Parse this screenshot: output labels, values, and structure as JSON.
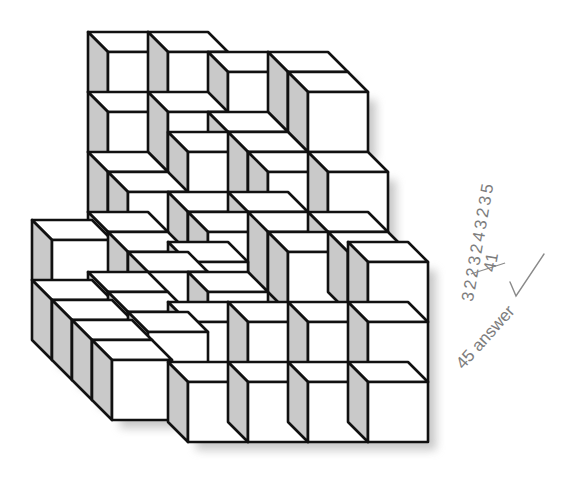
{
  "figure": {
    "cube_size_px": 60,
    "depth_offset_px": 20,
    "colors": {
      "front_face": "#ffffff",
      "top_face": "#ffffff",
      "side_face": "#c9c9c9",
      "edge": "#111111",
      "shadow": "#9a9a9a"
    },
    "cubes": [
      {
        "x": 108,
        "y": 52
      },
      {
        "x": 168,
        "y": 52
      },
      {
        "x": 108,
        "y": 112
      },
      {
        "x": 168,
        "y": 112
      },
      {
        "x": 108,
        "y": 172
      },
      {
        "x": 108,
        "y": 232
      },
      {
        "x": 108,
        "y": 292
      },
      {
        "x": 228,
        "y": 72
      },
      {
        "x": 288,
        "y": 72
      },
      {
        "x": 228,
        "y": 132
      },
      {
        "x": 308,
        "y": 92
      },
      {
        "x": 188,
        "y": 152
      },
      {
        "x": 248,
        "y": 152
      },
      {
        "x": 188,
        "y": 212
      },
      {
        "x": 248,
        "y": 212
      },
      {
        "x": 268,
        "y": 172
      },
      {
        "x": 328,
        "y": 172
      },
      {
        "x": 268,
        "y": 232
      },
      {
        "x": 328,
        "y": 232
      },
      {
        "x": 128,
        "y": 192
      },
      {
        "x": 128,
        "y": 252
      },
      {
        "x": 128,
        "y": 312
      },
      {
        "x": 148,
        "y": 272
      },
      {
        "x": 148,
        "y": 332
      },
      {
        "x": 208,
        "y": 232
      },
      {
        "x": 208,
        "y": 292
      },
      {
        "x": 288,
        "y": 252
      },
      {
        "x": 348,
        "y": 252
      },
      {
        "x": 52,
        "y": 240
      },
      {
        "x": 52,
        "y": 300
      },
      {
        "x": 72,
        "y": 320
      },
      {
        "x": 92,
        "y": 340
      },
      {
        "x": 112,
        "y": 360
      },
      {
        "x": 188,
        "y": 262
      },
      {
        "x": 368,
        "y": 262
      },
      {
        "x": 188,
        "y": 322
      },
      {
        "x": 248,
        "y": 322
      },
      {
        "x": 308,
        "y": 322
      },
      {
        "x": 368,
        "y": 322
      },
      {
        "x": 188,
        "y": 382
      },
      {
        "x": 248,
        "y": 382
      },
      {
        "x": 308,
        "y": 382
      },
      {
        "x": 368,
        "y": 382
      }
    ]
  },
  "annotations": {
    "tally_digits": "3 2 2 3 2 4 3 2 3 5",
    "tally_total": "41",
    "check_mark": "✓",
    "answer": "45 answer"
  }
}
